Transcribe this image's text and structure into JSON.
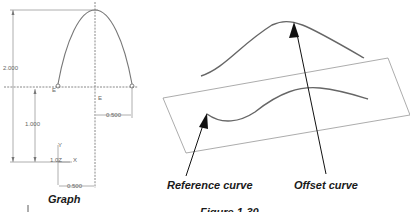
{
  "left_panel": {
    "caption": "Graph",
    "dimensions": {
      "height_total": "2.000",
      "height_lower": "1.000",
      "offset_right": "0.500",
      "offset_bottom": "0.500"
    },
    "point_labels": {
      "left": "E",
      "center": "E"
    },
    "axes": {
      "y": "Y",
      "x": "X",
      "z": "1.0Z"
    }
  },
  "right_panel": {
    "labels": {
      "reference_curve": "Reference curve",
      "offset_curve": "Offset curve"
    },
    "figure_caption": "Figure 1-30"
  },
  "colors": {
    "curve": "#555555",
    "arrow": "#111111",
    "plane": "#888888",
    "dimension": "#999999"
  }
}
